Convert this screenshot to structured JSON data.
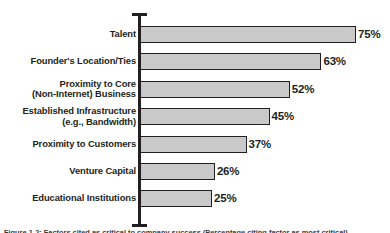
{
  "chart_data": {
    "type": "bar",
    "orientation": "horizontal",
    "title": "",
    "subtitle": "",
    "xlabel": "",
    "ylabel": "",
    "xlim": [
      0,
      80
    ],
    "grid": false,
    "legend": null,
    "value_suffix": "%",
    "categories": [
      "Talent",
      "Founder's Location/Ties",
      "Proximity to Core\n(Non-Internet) Business",
      "Established Infrastructure\n(e.g., Bandwidth)",
      "Proximity to Customers",
      "Venture Capital",
      "Educational Institutions"
    ],
    "values": [
      75,
      63,
      52,
      45,
      37,
      26,
      25
    ],
    "value_labels": [
      "75%",
      "63%",
      "52%",
      "45%",
      "37%",
      "26%",
      "25%"
    ],
    "bars": [
      {
        "category": "Talent",
        "label_lines": [
          "Talent"
        ],
        "value": 75,
        "value_label": "75%",
        "two_line": false
      },
      {
        "category": "Founder's Location/Ties",
        "label_lines": [
          "Founder's Location/Ties"
        ],
        "value": 63,
        "value_label": "63%",
        "two_line": false
      },
      {
        "category": "Proximity to Core (Non-Internet) Business",
        "label_lines": [
          "Proximity to Core",
          "(Non-Internet) Business"
        ],
        "value": 52,
        "value_label": "52%",
        "two_line": true
      },
      {
        "category": "Established Infrastructure (e.g., Bandwidth)",
        "label_lines": [
          "Established Infrastructure",
          "(e.g., Bandwidth)"
        ],
        "value": 45,
        "value_label": "45%",
        "two_line": true
      },
      {
        "category": "Proximity to Customers",
        "label_lines": [
          "Proximity to Customers"
        ],
        "value": 37,
        "value_label": "37%",
        "two_line": false
      },
      {
        "category": "Venture Capital",
        "label_lines": [
          "Venture Capital"
        ],
        "value": 26,
        "value_label": "26%",
        "two_line": false
      },
      {
        "category": "Educational Institutions",
        "label_lines": [
          "Educational Institutions"
        ],
        "value": 25,
        "value_label": "25%",
        "two_line": false
      }
    ],
    "colors": {
      "bar_fill": "#c9c9c9",
      "bar_border": "#231f20",
      "axis": "#231f20",
      "text": "#231f20",
      "background": "#ffffff"
    }
  },
  "caption": {
    "text": "Figure 1-2: Factors cited as critical to company success (Percentage citing factor as most critical)"
  }
}
